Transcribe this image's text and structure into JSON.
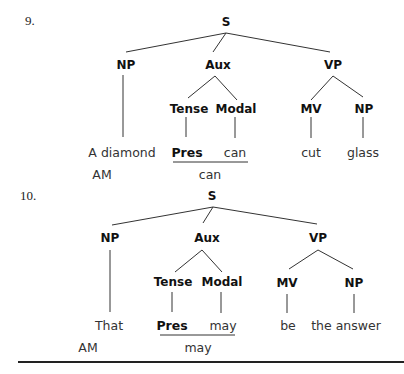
{
  "trees": [
    {
      "number": "9.",
      "nodes": {
        "s": "S",
        "np": "NP",
        "aux": "Aux",
        "vp": "VP",
        "tense": "Tense",
        "modal": "Modal",
        "mv": "MV",
        "np2": "NP"
      },
      "leaves": {
        "np": "A diamond",
        "tense": "Pres",
        "modal": "can",
        "mv": "cut",
        "np2": "glass"
      },
      "surface": {
        "am": "AM",
        "aux": "can"
      }
    },
    {
      "number": "10.",
      "nodes": {
        "s": "S",
        "np": "NP",
        "aux": "Aux",
        "vp": "VP",
        "tense": "Tense",
        "modal": "Modal",
        "mv": "MV",
        "np2": "NP"
      },
      "leaves": {
        "np": "That",
        "tense": "Pres",
        "modal": "may",
        "mv": "be",
        "np2": "the answer"
      },
      "surface": {
        "am": "AM",
        "aux": "may"
      }
    }
  ]
}
